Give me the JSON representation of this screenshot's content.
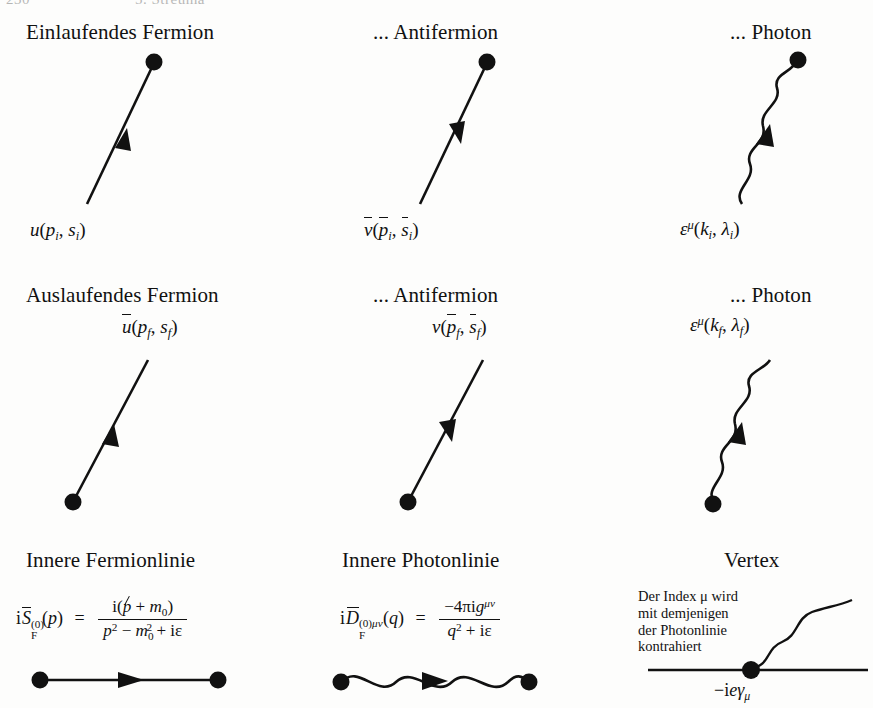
{
  "running_head": {
    "page_number": "230",
    "chapter": "5. Streuma"
  },
  "colors": {
    "ink": "#111111",
    "paper": "#fdfdfc"
  },
  "rows": [
    {
      "id": "incoming",
      "cells": [
        {
          "id": "incoming-fermion",
          "heading": "Einlaufendes Fermion",
          "line_type": "straight",
          "arrow": "up-toward-dot",
          "dot": "top",
          "formula_plain": "u(p_i, s_i)",
          "formula_parts": {
            "fn": "u",
            "open": "(",
            "arg1": "p",
            "sub1": "i",
            "comma": ",",
            "arg2": "s",
            "sub2": "i",
            "close": ")"
          }
        },
        {
          "id": "incoming-antifermion",
          "heading": "... Antifermion",
          "line_type": "straight",
          "arrow": "down-away-from-dot",
          "dot": "top",
          "formula_plain": "v̄(p̄_i, s̄_i)",
          "formula_parts": {
            "fn": "v",
            "open": "(",
            "arg1": "p",
            "sub1": "i",
            "comma": ",",
            "arg2": "s",
            "sub2": "i",
            "close": ")"
          }
        },
        {
          "id": "incoming-photon",
          "heading": "... Photon",
          "line_type": "wavy",
          "arrow": "up-toward-dot",
          "dot": "top",
          "formula_plain": "ε^μ(k_i, λ_i)",
          "formula_parts": {
            "fn": "ε",
            "sup": "μ",
            "open": "(",
            "arg1": "k",
            "sub1": "i",
            "comma": ",",
            "arg2": "λ",
            "sub2": "i",
            "close": ")"
          }
        }
      ]
    },
    {
      "id": "outgoing",
      "cells": [
        {
          "id": "outgoing-fermion",
          "heading": "Auslaufendes Fermion",
          "line_type": "straight",
          "arrow": "up-away-from-dot",
          "dot": "bottom",
          "formula_plain": "ū(p_f, s_f)",
          "formula_parts": {
            "fn": "u",
            "open": "(",
            "arg1": "p",
            "sub1": "f",
            "comma": ",",
            "arg2": "s",
            "sub2": "f",
            "close": ")"
          }
        },
        {
          "id": "outgoing-antifermion",
          "heading": "... Antifermion",
          "line_type": "straight",
          "arrow": "down-toward-dot",
          "dot": "bottom",
          "formula_plain": "v(p̄_f, s̄_f)",
          "formula_parts": {
            "fn": "v",
            "open": "(",
            "arg1": "p",
            "sub1": "f",
            "comma": ",",
            "arg2": "s",
            "sub2": "f",
            "close": ")"
          }
        },
        {
          "id": "outgoing-photon",
          "heading": "... Photon",
          "line_type": "wavy",
          "arrow": "up-away-from-dot",
          "dot": "bottom",
          "formula_plain": "ε^μ(k_f, λ_f)",
          "formula_parts": {
            "fn": "ε",
            "sup": "μ",
            "open": "(",
            "arg1": "k",
            "sub1": "f",
            "comma": ",",
            "arg2": "λ",
            "sub2": "f",
            "close": ")"
          }
        }
      ]
    },
    {
      "id": "internal",
      "cells": [
        {
          "id": "internal-fermion-line",
          "heading": "Innere Fermionlinie",
          "line_type": "straight-horizontal",
          "arrow": "right-middle",
          "dot": "both",
          "formula_plain": "iS̃_F^(0)(p) = i(p̸ + m_0) / (p² − m_0² + iε)",
          "lhs": {
            "i": "i",
            "S": "S",
            "sub": "F",
            "sup": "(0)",
            "arg": "(p)"
          },
          "eq": "=",
          "numerator": "i(p̸ + m₀)",
          "denominator": "p² − m₀² + iε"
        },
        {
          "id": "internal-photon-line",
          "heading": "Innere Photonlinie",
          "line_type": "wavy-horizontal",
          "arrow": "right-middle",
          "dot": "both",
          "formula_plain": "iD̃_F^(0)μν(q) = −4πig^μν / (q² + iε)",
          "lhs": {
            "i": "i",
            "D": "D",
            "sub": "F",
            "sup": "(0)μν",
            "arg": "(q)"
          },
          "eq": "=",
          "numerator": "−4πig^μν",
          "denominator": "q² + iε"
        },
        {
          "id": "vertex",
          "heading": "Vertex",
          "line_type": "vertex",
          "dot": "center",
          "note_lines": [
            "Der Index μ wird",
            "mit demjenigen",
            "der Photonlinie",
            "kontrahiert"
          ],
          "formula_plain": "−ieγ_μ",
          "formula_parts": {
            "minus": "−",
            "i": "i",
            "e": "e",
            "gamma": "γ",
            "sub": "μ"
          }
        }
      ]
    }
  ]
}
